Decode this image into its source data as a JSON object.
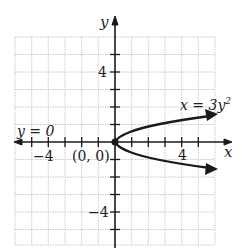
{
  "diagram": {
    "type": "coordinate-graph",
    "x_axis_label": "x",
    "y_axis_label": "y",
    "x_range": [
      -6,
      6
    ],
    "y_range": [
      -6,
      6
    ],
    "grid_step": 1,
    "tick_labels": {
      "x_neg": "−4",
      "x_pos": "4",
      "y_pos": "4",
      "y_neg": "−4"
    },
    "origin_label": "(0, 0)",
    "axis_of_symmetry_label": "y = 0",
    "curve_label": "x = 3y",
    "curve_label_exponent": "2",
    "curve_equation": "x = 3y^2",
    "vertex": [
      0,
      0
    ],
    "colors": {
      "grid": "#bdbdbd",
      "axes": "#1a1a1a",
      "curve": "#1a1a1a"
    }
  }
}
